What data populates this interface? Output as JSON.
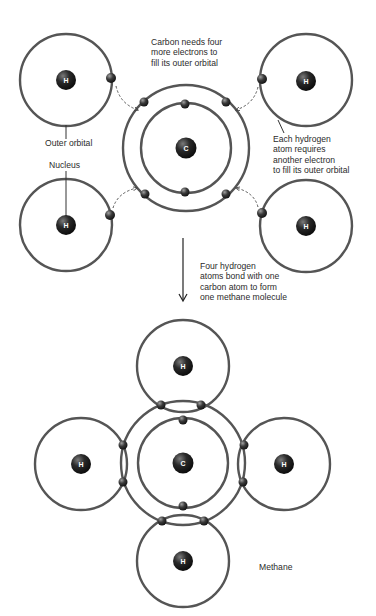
{
  "diagram": {
    "colors": {
      "orbital_stroke": "#555555",
      "nucleus_dark": "#141414",
      "nucleus_light": "#6e6e6e",
      "electron_dark": "#202020",
      "electron_light": "#8a8a8a",
      "text": "#2b2b2b",
      "background": "#ffffff"
    },
    "nucleus_symbols": {
      "hydrogen": "H",
      "carbon": "C"
    },
    "top_section": {
      "annotations": {
        "carbon_needs": "Carbon needs four\nmore electrons to\nfill its outer orbital",
        "outer_orbital": "Outer orbital",
        "nucleus": "Nucleus",
        "hydrogen_requires": "Each hydrogen\natom requires\nanother electron\nto fill its outer orbital"
      },
      "hydrogen_atoms": [
        {
          "position": "top-left",
          "cx": 66,
          "cy": 80,
          "r": 46
        },
        {
          "position": "top-right",
          "cx": 306,
          "cy": 80,
          "r": 46
        },
        {
          "position": "bottom-left",
          "cx": 66,
          "cy": 225,
          "r": 46
        },
        {
          "position": "bottom-right",
          "cx": 306,
          "cy": 226,
          "r": 46
        }
      ],
      "carbon_atom": {
        "cx": 186,
        "cy": 148,
        "outer_r": 63,
        "inner_r": 45,
        "outer_electrons": 4,
        "inner_electrons": 2
      }
    },
    "transition": {
      "arrow": "down-arrow",
      "caption": "Four hydrogen\natoms bond with one\ncarbon atom to form\none methane molecule"
    },
    "bottom_section": {
      "label": "Methane",
      "molecule": "CH4",
      "carbon_atom": {
        "cx": 183,
        "cy": 463,
        "outer_r": 62,
        "inner_r": 45
      },
      "hydrogen_atoms": [
        {
          "position": "top",
          "cx": 183,
          "cy": 366,
          "r": 46
        },
        {
          "position": "left",
          "cx": 81,
          "cy": 464,
          "r": 46
        },
        {
          "position": "right",
          "cx": 284,
          "cy": 464,
          "r": 46
        },
        {
          "position": "bottom",
          "cx": 183,
          "cy": 561,
          "r": 46
        }
      ],
      "shared_electron_pairs": 4
    }
  }
}
